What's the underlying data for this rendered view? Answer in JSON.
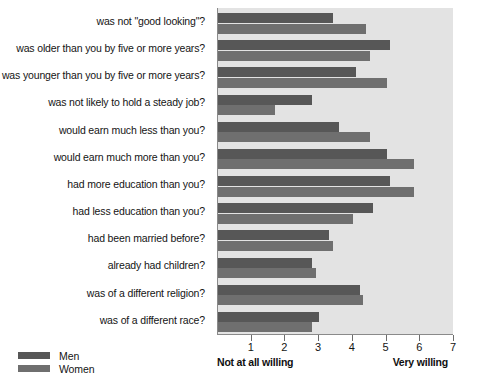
{
  "chart_data": {
    "type": "bar",
    "orientation": "horizontal",
    "title": "",
    "subtitle": "",
    "xlabel": "",
    "ylabel": "",
    "xlim": [
      0,
      7
    ],
    "xticks": [
      1,
      2,
      3,
      4,
      5,
      6,
      7
    ],
    "xticklabels": [
      "1",
      "2",
      "3",
      "4",
      "5",
      "6",
      "7"
    ],
    "axis_low_label": "Not at all willing",
    "axis_high_label": "Very willing",
    "grid": false,
    "legend_position": "bottom-left",
    "categories": [
      "was not \"good looking\"?",
      "was older than you by five or more years?",
      "was younger than you by five or more years?",
      "was not likely to hold a steady job?",
      "would earn much less than you?",
      "would earn much more than you?",
      "had more education than you?",
      "had less education than you?",
      "had been married before?",
      "already had children?",
      "was of a different religion?",
      "was of a different race?"
    ],
    "series": [
      {
        "name": "Men",
        "color": "#575757",
        "values": [
          3.4,
          5.1,
          4.1,
          2.8,
          3.6,
          5.0,
          5.1,
          4.6,
          3.3,
          2.8,
          4.2,
          3.0
        ]
      },
      {
        "name": "Women",
        "color": "#6f6f6f",
        "values": [
          4.4,
          4.5,
          5.0,
          1.7,
          4.5,
          5.8,
          5.8,
          4.0,
          3.4,
          2.9,
          4.3,
          2.8
        ]
      }
    ]
  },
  "legend": {
    "items": [
      {
        "label": "Men",
        "color": "#575757"
      },
      {
        "label": "Women",
        "color": "#6f6f6f"
      }
    ]
  },
  "axis": {
    "low": "Not at all willing",
    "high": "Very willing"
  }
}
